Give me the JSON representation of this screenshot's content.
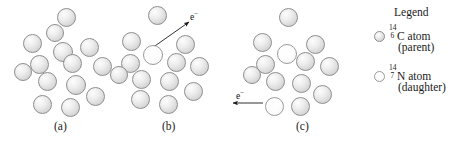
{
  "figure": {
    "panels": [
      {
        "id": "panel-a",
        "label": "(a)",
        "label_x": 54,
        "label_y": 120,
        "origin_x": 8,
        "atoms": [
          {
            "x": 57,
            "y": 8,
            "r": 9.5,
            "type": "parent"
          },
          {
            "x": 23,
            "y": 34,
            "r": 9.5,
            "type": "parent"
          },
          {
            "x": 53,
            "y": 42,
            "r": 10,
            "type": "parent"
          },
          {
            "x": 80,
            "y": 38,
            "r": 9.5,
            "type": "parent"
          },
          {
            "x": 30,
            "y": 55,
            "r": 9.5,
            "type": "parent"
          },
          {
            "x": 63,
            "y": 54,
            "r": 9.5,
            "type": "parent"
          },
          {
            "x": 93,
            "y": 57,
            "r": 9.5,
            "type": "parent"
          },
          {
            "x": 38,
            "y": 72,
            "r": 9.5,
            "type": "parent"
          },
          {
            "x": 66,
            "y": 75,
            "r": 10,
            "type": "parent"
          },
          {
            "x": 86,
            "y": 87,
            "r": 9.5,
            "type": "parent"
          },
          {
            "x": 33,
            "y": 95,
            "r": 9.5,
            "type": "parent"
          },
          {
            "x": 61,
            "y": 98,
            "r": 9.5,
            "type": "parent"
          },
          {
            "x": 14,
            "y": 63,
            "r": 9,
            "type": "parent"
          },
          {
            "x": 46,
            "y": 24,
            "r": 9,
            "type": "parent"
          }
        ],
        "electron": null
      },
      {
        "id": "panel-b",
        "label": "(b)",
        "label_x": 162,
        "label_y": 120,
        "origin_x": 116,
        "atoms": [
          {
            "x": 148,
            "y": 6,
            "r": 9.5,
            "type": "parent"
          },
          {
            "x": 122,
            "y": 32,
            "r": 9.5,
            "type": "parent"
          },
          {
            "x": 143,
            "y": 45,
            "r": 10,
            "type": "daughter"
          },
          {
            "x": 176,
            "y": 35,
            "r": 9.5,
            "type": "parent"
          },
          {
            "x": 121,
            "y": 54,
            "r": 9.5,
            "type": "parent"
          },
          {
            "x": 167,
            "y": 53,
            "r": 9.5,
            "type": "parent"
          },
          {
            "x": 190,
            "y": 57,
            "r": 9.5,
            "type": "parent"
          },
          {
            "x": 132,
            "y": 70,
            "r": 9.5,
            "type": "parent"
          },
          {
            "x": 160,
            "y": 72,
            "r": 9.5,
            "type": "parent"
          },
          {
            "x": 184,
            "y": 82,
            "r": 9.5,
            "type": "parent"
          },
          {
            "x": 131,
            "y": 90,
            "r": 9.5,
            "type": "parent"
          },
          {
            "x": 159,
            "y": 95,
            "r": 9.5,
            "type": "parent"
          },
          {
            "x": 110,
            "y": 66,
            "r": 9,
            "type": "parent"
          }
        ],
        "electron": {
          "label": "e",
          "charge": "−",
          "label_x": 190,
          "label_y": 10,
          "arrow_x1": 152,
          "arrow_y1": 48,
          "arrow_x2": 189,
          "arrow_y2": 22
        }
      },
      {
        "id": "panel-c",
        "label": "(c)",
        "label_x": 296,
        "label_y": 120,
        "origin_x": 248,
        "atoms": [
          {
            "x": 279,
            "y": 8,
            "r": 9.5,
            "type": "parent"
          },
          {
            "x": 253,
            "y": 33,
            "r": 9.5,
            "type": "parent"
          },
          {
            "x": 277,
            "y": 44,
            "r": 10,
            "type": "daughter"
          },
          {
            "x": 306,
            "y": 35,
            "r": 9.5,
            "type": "parent"
          },
          {
            "x": 256,
            "y": 55,
            "r": 9.5,
            "type": "parent"
          },
          {
            "x": 296,
            "y": 52,
            "r": 9.5,
            "type": "parent"
          },
          {
            "x": 320,
            "y": 57,
            "r": 9.5,
            "type": "parent"
          },
          {
            "x": 266,
            "y": 72,
            "r": 9.5,
            "type": "parent"
          },
          {
            "x": 292,
            "y": 74,
            "r": 9.5,
            "type": "parent"
          },
          {
            "x": 313,
            "y": 85,
            "r": 9.5,
            "type": "parent"
          },
          {
            "x": 265,
            "y": 97,
            "r": 9.5,
            "type": "daughter"
          },
          {
            "x": 291,
            "y": 97,
            "r": 9.5,
            "type": "parent"
          },
          {
            "x": 243,
            "y": 66,
            "r": 9,
            "type": "parent"
          }
        ],
        "electron": {
          "label": "e",
          "charge": "−",
          "label_x": 236,
          "label_y": 89,
          "arrow_x1": 263,
          "arrow_y1": 103,
          "arrow_x2": 233,
          "arrow_y2": 103
        }
      }
    ]
  },
  "legend": {
    "title": "Legend",
    "entries": [
      {
        "swatch": "parent",
        "mass_number": "14",
        "atomic_number": "6",
        "symbol": "C atom",
        "role": "(parent)"
      },
      {
        "swatch": "daughter",
        "mass_number": "14",
        "atomic_number": "7",
        "symbol": "N atom",
        "role": "(daughter)"
      }
    ]
  }
}
